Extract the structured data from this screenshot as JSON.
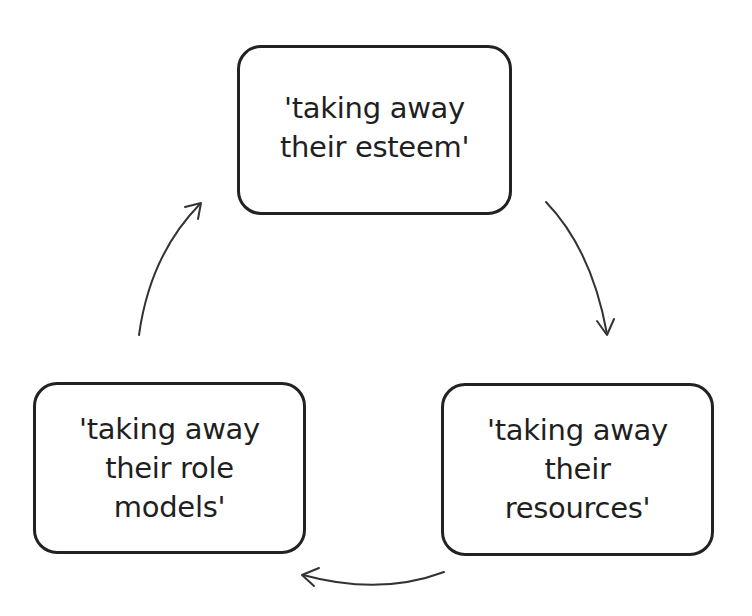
{
  "diagram": {
    "type": "cycle",
    "nodes": [
      {
        "id": "top",
        "label": "'taking away\ntheir esteem'"
      },
      {
        "id": "right",
        "label": "'taking away\ntheir\nresources'"
      },
      {
        "id": "left",
        "label": "'taking away\ntheir role\nmodels'"
      }
    ],
    "edges": [
      {
        "from": "top",
        "to": "right",
        "direction": "clockwise"
      },
      {
        "from": "right",
        "to": "left",
        "direction": "clockwise"
      },
      {
        "from": "left",
        "to": "top",
        "direction": "clockwise"
      }
    ],
    "colors": {
      "border": "#222222",
      "text": "#1f1f1f",
      "arrow": "#333333",
      "background": "#ffffff"
    }
  }
}
